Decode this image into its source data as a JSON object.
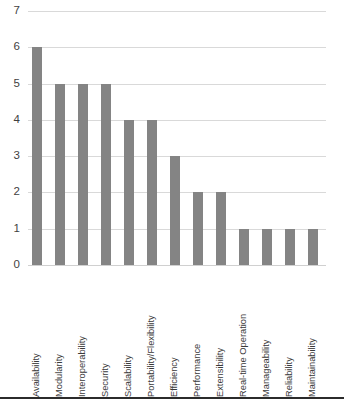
{
  "chart_data": {
    "type": "bar",
    "title": "",
    "subtitle": "",
    "xlabel": "",
    "ylabel": "",
    "ylim": [
      0,
      7
    ],
    "yticks": [
      0,
      1,
      2,
      3,
      4,
      5,
      6,
      7
    ],
    "ytick_labels": [
      "0",
      "1",
      "2",
      "3",
      "4",
      "5",
      "6",
      "7"
    ],
    "grid": "horizontal",
    "legend": "none",
    "bar_color": "#848484",
    "gridline_color": "#d9d9d9",
    "axis_text_color": "#3f3f3f",
    "categories": [
      "Availability",
      "Modularity",
      "Interoperability",
      "Security",
      "Scalability",
      "Portability/Flexibility",
      "Efficiency",
      "Performance",
      "Extensibility",
      "Real-time Operation",
      "Manageability",
      "Reliability",
      "Maintainability"
    ],
    "values": [
      6,
      5,
      5,
      5,
      4,
      4,
      3,
      2,
      2,
      1,
      1,
      1,
      1
    ]
  },
  "figure": {
    "bottom_rule_color": "#2b2b2b",
    "caption_fragment": ""
  }
}
